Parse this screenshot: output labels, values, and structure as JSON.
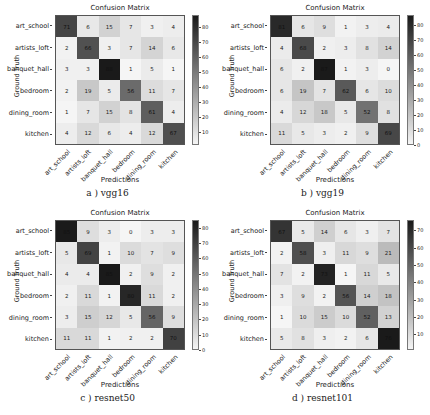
{
  "labels": [
    "art_school",
    "artists_loft",
    "banquet_hall",
    "bedroom",
    "dining_room",
    "kitchen"
  ],
  "xlabel": "Predictions",
  "ylabel": "Ground Truth",
  "title": "Confusion Matrix",
  "chart_data": [
    {
      "type": "heatmap",
      "caption": "a ) vgg16",
      "title": "Confusion Matrix",
      "xlabel": "Predictions",
      "ylabel": "Ground Truth",
      "categories": [
        "art_school",
        "artists_loft",
        "banquet_hall",
        "bedroom",
        "dining_room",
        "kitchen"
      ],
      "values": [
        [
          71,
          6,
          15,
          7,
          3,
          4
        ],
        [
          2,
          66,
          3,
          7,
          14,
          6
        ],
        [
          3,
          3,
          88,
          1,
          5,
          1
        ],
        [
          2,
          19,
          5,
          56,
          11,
          7
        ],
        [
          1,
          7,
          15,
          8,
          61,
          4
        ],
        [
          4,
          12,
          6,
          4,
          12,
          67
        ]
      ],
      "colorbar_ticks": [
        10,
        20,
        30,
        40,
        50,
        60,
        70,
        80
      ],
      "vmin": 1,
      "vmax": 88
    },
    {
      "type": "heatmap",
      "caption": "b ) vgg19",
      "title": "Confusion Matrix",
      "xlabel": "Predictions",
      "ylabel": "Ground Truth",
      "categories": [
        "art_school",
        "artists_loft",
        "banquet_hall",
        "bedroom",
        "dining_room",
        "kitchen"
      ],
      "values": [
        [
          81,
          6,
          9,
          1,
          3,
          4
        ],
        [
          4,
          68,
          2,
          3,
          8,
          14
        ],
        [
          6,
          2,
          87,
          1,
          3,
          0
        ],
        [
          6,
          19,
          7,
          62,
          6,
          10
        ],
        [
          4,
          12,
          18,
          5,
          52,
          8
        ],
        [
          11,
          5,
          3,
          2,
          9,
          69
        ]
      ],
      "colorbar_ticks": [
        0,
        10,
        20,
        30,
        40,
        50,
        60,
        70,
        80
      ],
      "vmin": 0,
      "vmax": 87
    },
    {
      "type": "heatmap",
      "caption": "c ) resnet50",
      "title": "Confusion Matrix",
      "xlabel": "Predictions",
      "ylabel": "Ground Truth",
      "categories": [
        "art_school",
        "artists_loft",
        "banquet_hall",
        "bedroom",
        "dining_room",
        "kitchen"
      ],
      "values": [
        [
          85,
          9,
          3,
          0,
          3,
          3
        ],
        [
          5,
          69,
          1,
          10,
          7,
          9
        ],
        [
          4,
          4,
          85,
          2,
          9,
          2
        ],
        [
          2,
          11,
          1,
          80,
          11,
          2
        ],
        [
          3,
          15,
          12,
          5,
          56,
          9
        ],
        [
          11,
          11,
          1,
          2,
          2,
          70
        ]
      ],
      "colorbar_ticks": [
        0,
        10,
        20,
        30,
        40,
        50,
        60,
        70,
        80
      ],
      "vmin": 0,
      "vmax": 85
    },
    {
      "type": "heatmap",
      "caption": "d ) resnet101",
      "title": "Confusion Matrix",
      "xlabel": "Predictions",
      "ylabel": "Ground Truth",
      "categories": [
        "art_school",
        "artists_loft",
        "banquet_hall",
        "bedroom",
        "dining_room",
        "kitchen"
      ],
      "values": [
        [
          67,
          5,
          14,
          6,
          3,
          7
        ],
        [
          2,
          58,
          3,
          11,
          9,
          21
        ],
        [
          7,
          2,
          73,
          1,
          11,
          5
        ],
        [
          3,
          9,
          2,
          56,
          14,
          18
        ],
        [
          1,
          10,
          15,
          10,
          52,
          13
        ],
        [
          5,
          8,
          3,
          2,
          6,
          76
        ]
      ],
      "colorbar_ticks": [
        10,
        20,
        30,
        40,
        50,
        60,
        70
      ],
      "vmin": 1,
      "vmax": 76
    }
  ]
}
